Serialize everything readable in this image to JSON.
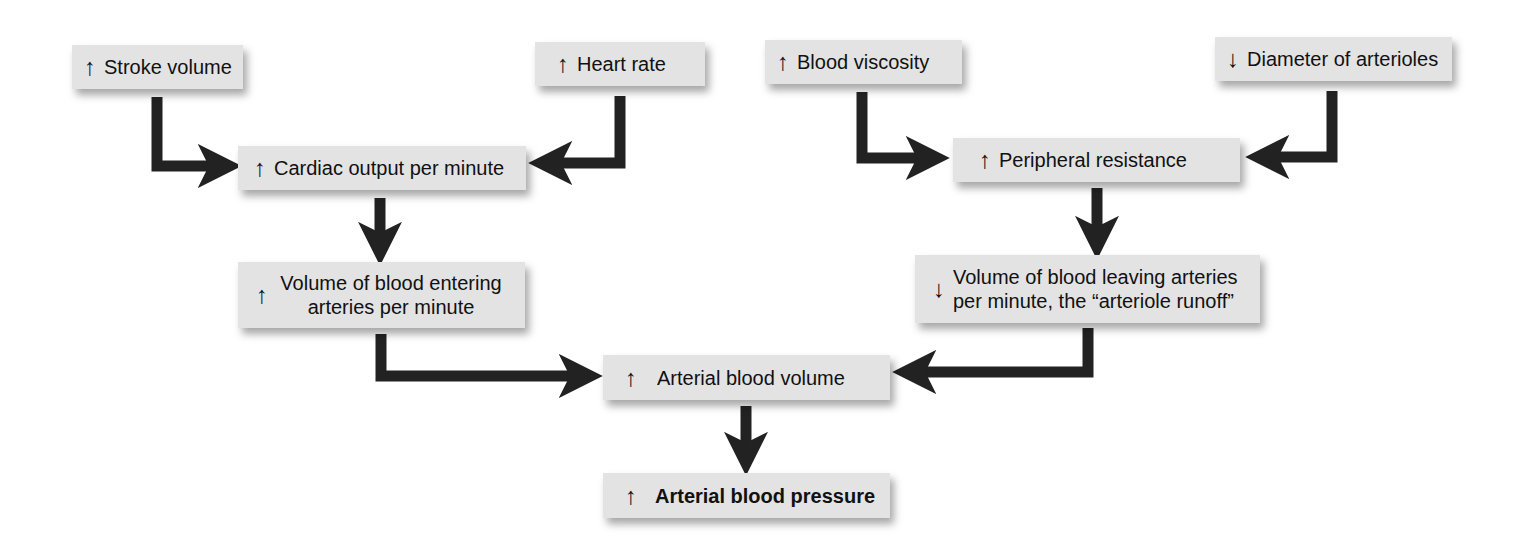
{
  "diagram": {
    "type": "flowchart",
    "colors": {
      "box_fill": "#e3e3e3",
      "connector": "#222222",
      "background": "#ffffff"
    },
    "nodes": [
      {
        "id": "stroke_volume",
        "direction": "↑",
        "label": "Stroke volume"
      },
      {
        "id": "heart_rate",
        "direction": "↑",
        "label": "Heart rate"
      },
      {
        "id": "blood_viscosity",
        "direction": "↑",
        "label": "Blood viscosity"
      },
      {
        "id": "diameter_arterioles",
        "direction": "↓",
        "label": "Diameter of arterioles"
      },
      {
        "id": "cardiac_output",
        "direction": "↑",
        "label": "Cardiac output per minute"
      },
      {
        "id": "peripheral_resistance",
        "direction": "↑",
        "label": "Peripheral resistance"
      },
      {
        "id": "volume_entering",
        "direction": "↑",
        "label": "Volume of blood entering arteries per minute"
      },
      {
        "id": "volume_leaving",
        "direction": "↓",
        "label": "Volume of blood leaving arteries per minute, the “arteriole runoff”"
      },
      {
        "id": "arterial_volume",
        "direction": "↑",
        "label": "Arterial blood volume"
      },
      {
        "id": "arterial_pressure",
        "direction": "↑",
        "label": "Arterial blood pressure"
      }
    ],
    "edges": [
      {
        "from": "stroke_volume",
        "to": "cardiac_output"
      },
      {
        "from": "heart_rate",
        "to": "cardiac_output"
      },
      {
        "from": "blood_viscosity",
        "to": "peripheral_resistance"
      },
      {
        "from": "diameter_arterioles",
        "to": "peripheral_resistance"
      },
      {
        "from": "cardiac_output",
        "to": "volume_entering"
      },
      {
        "from": "peripheral_resistance",
        "to": "volume_leaving"
      },
      {
        "from": "volume_entering",
        "to": "arterial_volume"
      },
      {
        "from": "volume_leaving",
        "to": "arterial_volume"
      },
      {
        "from": "arterial_volume",
        "to": "arterial_pressure"
      }
    ]
  }
}
